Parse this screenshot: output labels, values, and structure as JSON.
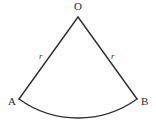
{
  "figure": {
    "kind": "circular-sector-diagram",
    "background_color": "#fefefe",
    "stroke_color": "#2e2e2e",
    "stroke_width": 1.4,
    "width": 156,
    "height": 126,
    "labels": {
      "apex": "O",
      "left_endpoint": "A",
      "right_endpoint": "B",
      "left_radius": "r",
      "right_radius": "r"
    },
    "points": {
      "O": {
        "x": 78,
        "y": 17
      },
      "A": {
        "x": 19,
        "y": 99
      },
      "B": {
        "x": 137,
        "y": 99
      }
    },
    "arc": {
      "start": {
        "x": 19,
        "y": 99
      },
      "end": {
        "x": 137,
        "y": 99
      },
      "sweep_bottom": {
        "x": 78,
        "y": 118
      },
      "radius": 101,
      "large_arc": 0,
      "sweep_flag": 1
    },
    "segments": [
      {
        "name": "radius-OA",
        "from": "O",
        "to": "A",
        "label": "r"
      },
      {
        "name": "radius-OB",
        "from": "O",
        "to": "B",
        "label": "r"
      },
      {
        "name": "arc-AB",
        "from": "A",
        "to": "B",
        "label": ""
      }
    ]
  }
}
